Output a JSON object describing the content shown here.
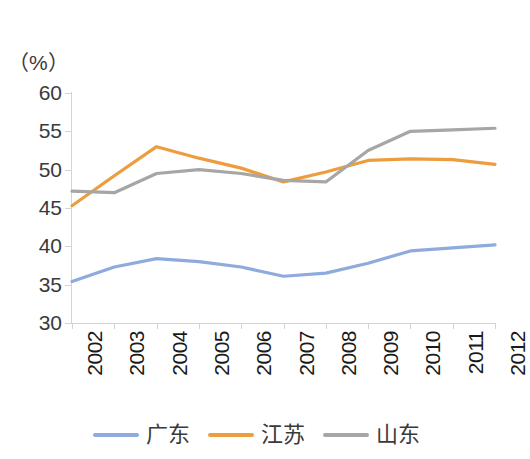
{
  "chart_data": {
    "type": "line",
    "title": "",
    "xlabel": "",
    "ylabel": "",
    "unit_label": "（%）",
    "categories": [
      "2002",
      "2003",
      "2004",
      "2005",
      "2006",
      "2007",
      "2008",
      "2009",
      "2010",
      "2011",
      "2012"
    ],
    "ylim": [
      30,
      60
    ],
    "yticks": [
      60,
      55,
      50,
      45,
      40,
      35,
      30
    ],
    "ytick_labels": [
      "60",
      "55",
      "50",
      "45",
      "40",
      "35",
      "30"
    ],
    "grid": false,
    "legend_position": "bottom",
    "series": [
      {
        "name": "广东",
        "color": "#8FAADC",
        "values": [
          35.4,
          37.3,
          38.4,
          38.0,
          37.3,
          36.1,
          36.5,
          37.8,
          39.4,
          39.8,
          40.2
        ]
      },
      {
        "name": "江苏",
        "color": "#ED9C3E",
        "values": [
          45.3,
          49.2,
          53.0,
          51.5,
          50.2,
          48.4,
          49.7,
          51.2,
          51.4,
          51.3,
          50.7
        ]
      },
      {
        "name": "山东",
        "color": "#A6A6A6",
        "values": [
          47.2,
          47.0,
          49.5,
          50.0,
          49.5,
          48.6,
          48.4,
          52.5,
          55.0,
          55.2,
          55.4
        ]
      }
    ]
  },
  "axis": {
    "line_color": "#D4D4D4"
  }
}
